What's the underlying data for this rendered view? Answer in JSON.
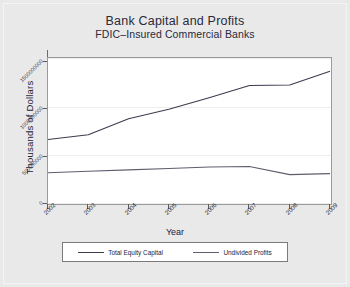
{
  "chart_data": {
    "type": "line",
    "title": "Bank Capital and Profits",
    "subtitle": "FDIC–Insured Commercial Banks",
    "xlabel": "Year",
    "ylabel": "Thousands of Dollars",
    "categories": [
      "2002",
      "2003",
      "2004",
      "2005",
      "2006",
      "2007",
      "2008",
      "2009"
    ],
    "x": [
      2002,
      2003,
      2004,
      2005,
      2006,
      2007,
      2008,
      2009
    ],
    "ylim": [
      0,
      1540000000
    ],
    "xlim": [
      2002,
      2009
    ],
    "yticks": [
      0,
      500000000,
      1000000000,
      1500000000
    ],
    "ytick_labels": [
      "0",
      "500000000",
      "1000000000",
      "1500000000"
    ],
    "grid": true,
    "legend_position": "bottom",
    "series": [
      {
        "name": "Total Equity Capital",
        "color": "#3c3c4e",
        "values": [
          680000000,
          730000000,
          900000000,
          1000000000,
          1120000000,
          1250000000,
          1255000000,
          1400000000
        ]
      },
      {
        "name": "Undivided Profits",
        "color": "#5e5e6e",
        "values": [
          330000000,
          345000000,
          360000000,
          375000000,
          390000000,
          395000000,
          310000000,
          320000000
        ]
      }
    ]
  },
  "colors": {
    "background": "#e9e9e9",
    "plot_background": "#ffffff",
    "axis": "#6a6a6a",
    "grid": "#ededed",
    "text": "#22223a",
    "series_1": "#3c3c4e",
    "series_2": "#5e5e6e"
  }
}
